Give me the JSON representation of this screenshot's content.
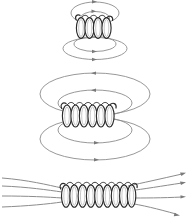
{
  "figure": {
    "stroke_colors": {
      "field_line": "#8c8c8c",
      "arrow": "#7a7a7a",
      "coil_outline": "#2b2b2b",
      "coil_fill": "#ffffff",
      "background": "#ffffff"
    },
    "panels": [
      {
        "id": "panel-short-solenoid",
        "label": "short solenoid",
        "coil": {
          "turns": 4,
          "center_x": 95,
          "center_y": 28,
          "turn_spacing": 8.4,
          "turn_rx": 4.6,
          "turn_ry": 10.5
        },
        "field_loops_above": [
          {
            "cx": 95,
            "cy": 13,
            "rx": 24,
            "ry": 11
          },
          {
            "cx": 95,
            "cy": 17,
            "rx": 15,
            "ry": 7
          }
        ],
        "field_loops_below": [
          {
            "cx": 95,
            "cy": 50,
            "rx": 33,
            "ry": 11
          },
          {
            "cx": 95,
            "cy": 45,
            "rx": 22,
            "ry": 8
          }
        ],
        "arrow_direction": "clockwise-right-at-top"
      },
      {
        "id": "panel-medium-solenoid",
        "label": "medium solenoid",
        "coil": {
          "turns": 6,
          "center_x": 95,
          "center_y": 116,
          "turn_spacing": 8.6,
          "turn_rx": 4.6,
          "turn_ry": 11.0
        },
        "field_loops_above": [
          {
            "cx": 95,
            "cy": 90,
            "rx": 56,
            "ry": 20
          },
          {
            "cx": 95,
            "cy": 99,
            "rx": 38,
            "ry": 13
          }
        ],
        "field_loops_below": [
          {
            "cx": 95,
            "cy": 143,
            "rx": 56,
            "ry": 20
          },
          {
            "cx": 95,
            "cy": 134,
            "rx": 38,
            "ry": 13
          }
        ],
        "arrow_direction": "left-at-top-right-at-bottom"
      },
      {
        "id": "panel-long-solenoid",
        "label": "long solenoid",
        "coil": {
          "turns": 9,
          "center_x": 96,
          "center_y": 196,
          "turn_spacing": 8.5,
          "turn_rx": 4.6,
          "turn_ry": 11.5
        },
        "field_lines_count": 4,
        "arrow_direction": "rightward-outward",
        "field_line_ys": [
          183,
          190,
          197,
          204
        ]
      }
    ]
  }
}
